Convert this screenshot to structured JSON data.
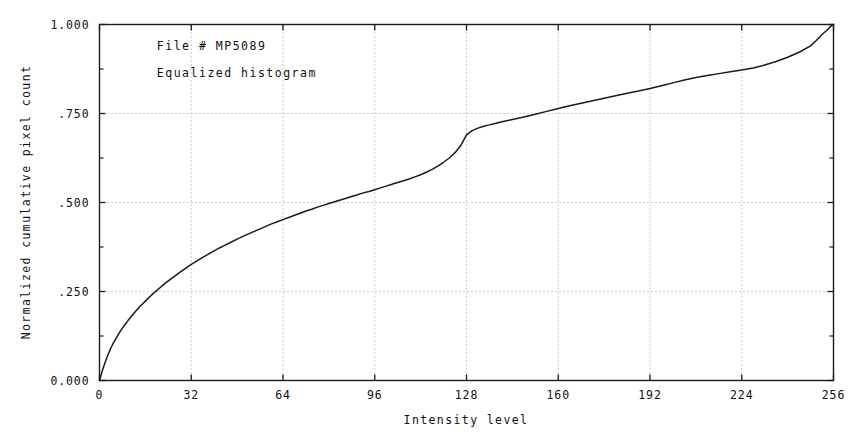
{
  "chart_data": {
    "type": "line",
    "title": "",
    "subtitle": "",
    "xlabel": "Intensity level",
    "ylabel": "Normalized cumulative pixel count",
    "xlim": [
      0,
      256
    ],
    "ylim": [
      0,
      1.0
    ],
    "grid": true,
    "grid_style": "dotted",
    "legend": "none",
    "annotations": [
      {
        "name": "file-annotation",
        "text": "File # MP5089",
        "x": 20,
        "y": 0.94
      },
      {
        "name": "description-annotation",
        "text": "Equalized histogram",
        "x": 20,
        "y": 0.865
      }
    ],
    "xticks": [
      0,
      32,
      64,
      96,
      128,
      160,
      192,
      224,
      256
    ],
    "xtick_labels": [
      "0",
      "32",
      "64",
      "96",
      "128",
      "160",
      "192",
      "224",
      "256"
    ],
    "yticks": [
      0.0,
      0.25,
      0.5,
      0.75,
      1.0
    ],
    "ytick_labels": [
      "0.000",
      ".250",
      ".500",
      ".750",
      "1.000"
    ],
    "minor_xticks": [
      16,
      48,
      80,
      112,
      144,
      176,
      208,
      240
    ],
    "minor_yticks": [
      0.125,
      0.375,
      0.625,
      0.875
    ],
    "series": [
      {
        "name": "Equalized cumulative distribution",
        "color": "#1a1a1a",
        "x": [
          0,
          1,
          2,
          3,
          4,
          5,
          6,
          7,
          8,
          9,
          10,
          11,
          12,
          13,
          14,
          15,
          16,
          17,
          18,
          19,
          20,
          22,
          24,
          26,
          28,
          30,
          32,
          34,
          36,
          38,
          40,
          42,
          44,
          46,
          48,
          50,
          52,
          54,
          56,
          58,
          60,
          62,
          64,
          66,
          68,
          70,
          72,
          74,
          76,
          78,
          80,
          82,
          84,
          86,
          88,
          90,
          92,
          94,
          96,
          98,
          100,
          102,
          104,
          106,
          108,
          110,
          112,
          114,
          116,
          118,
          120,
          122,
          124,
          126,
          128,
          130,
          132,
          134,
          136,
          138,
          140,
          144,
          148,
          152,
          156,
          160,
          164,
          168,
          172,
          176,
          180,
          184,
          188,
          192,
          196,
          200,
          204,
          208,
          212,
          216,
          220,
          224,
          228,
          232,
          236,
          240,
          244,
          248,
          250,
          252,
          254,
          255,
          256
        ],
        "y": [
          0.0,
          0.028,
          0.052,
          0.073,
          0.092,
          0.108,
          0.122,
          0.135,
          0.147,
          0.158,
          0.169,
          0.179,
          0.189,
          0.198,
          0.207,
          0.215,
          0.223,
          0.231,
          0.239,
          0.246,
          0.253,
          0.267,
          0.28,
          0.292,
          0.304,
          0.315,
          0.326,
          0.336,
          0.346,
          0.355,
          0.364,
          0.373,
          0.381,
          0.389,
          0.397,
          0.405,
          0.412,
          0.419,
          0.426,
          0.433,
          0.44,
          0.446,
          0.452,
          0.458,
          0.464,
          0.47,
          0.476,
          0.481,
          0.487,
          0.492,
          0.497,
          0.502,
          0.507,
          0.512,
          0.517,
          0.522,
          0.527,
          0.531,
          0.536,
          0.541,
          0.546,
          0.551,
          0.556,
          0.561,
          0.566,
          0.572,
          0.578,
          0.585,
          0.593,
          0.602,
          0.613,
          0.625,
          0.64,
          0.66,
          0.69,
          0.702,
          0.709,
          0.714,
          0.718,
          0.722,
          0.726,
          0.733,
          0.74,
          0.748,
          0.756,
          0.764,
          0.772,
          0.779,
          0.786,
          0.793,
          0.8,
          0.807,
          0.813,
          0.82,
          0.828,
          0.836,
          0.844,
          0.851,
          0.857,
          0.862,
          0.867,
          0.872,
          0.878,
          0.886,
          0.896,
          0.908,
          0.922,
          0.94,
          0.955,
          0.972,
          0.986,
          0.995,
          1.0
        ]
      }
    ]
  },
  "axes": {
    "x_title": "Intensity level",
    "y_title": "Normalized cumulative pixel count"
  }
}
